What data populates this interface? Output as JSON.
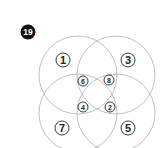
{
  "badge": {
    "label": "19",
    "color": "#111111"
  },
  "circle_color": "#aaaaaa",
  "labels": {
    "top_left": "1",
    "top_right": "3",
    "bottom_left": "7",
    "bottom_right": "5",
    "inner_top_left": "6",
    "inner_top_right": "8",
    "inner_bottom_left": "4",
    "inner_bottom_right": "2"
  }
}
